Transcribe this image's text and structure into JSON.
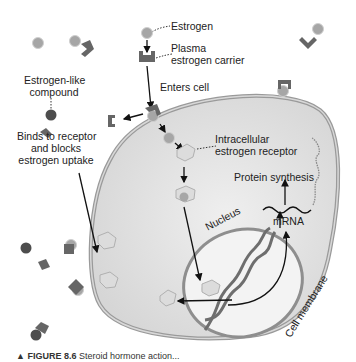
{
  "labels": {
    "estrogen": "Estrogen",
    "plasma_carrier_1": "Plasma",
    "plasma_carrier_2": "estrogen carrier",
    "estrogen_like_1": "Estrogen-like",
    "estrogen_like_2": "compound",
    "enters_cell": "Enters cell",
    "binds_1": "Binds to receptor",
    "binds_2": "and blocks",
    "binds_3": "estrogen uptake",
    "intracellular_1": "Intracellular",
    "intracellular_2": "estrogen receptor",
    "protein_synthesis": "Protein synthesis",
    "mrna": "mRNA",
    "nucleus": "Nucleus",
    "cell_membrane": "Cell membrane"
  },
  "caption": {
    "marker": "▲",
    "figure": "FIGURE 8.6",
    "text": "Steroid hormone action..."
  },
  "colors": {
    "cell_fill": "#e4e4e4",
    "membrane": "#b8b8b8",
    "nucleus_fill": "#f2f2f2",
    "estrogen": "#a8a8a8",
    "compound": "#555555",
    "carrier": "#6a6a6a",
    "receptor": "#d0d0d0"
  }
}
